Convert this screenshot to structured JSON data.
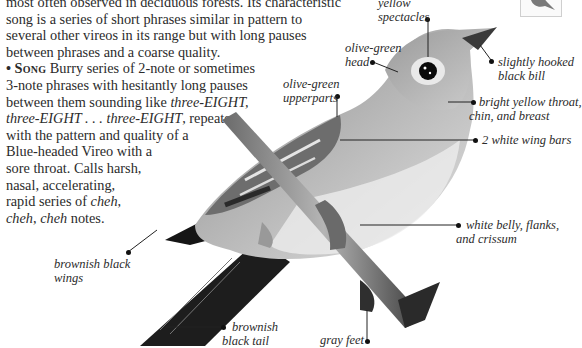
{
  "description": {
    "lines": [
      "most often observed in deciduous forests. Its characteristic",
      "song is a series of short phrases similar in pattern to",
      "several other vireos in its range but with long pauses",
      "between phrases and a coarse quality."
    ],
    "song": {
      "bullet": "•",
      "heading": "Song",
      "lines": [
        {
          "pre": " Burry series of 2-note or sometimes"
        },
        {
          "pre": "3-note phrases with hesitantly long pauses"
        },
        {
          "pre": "between them sounding like ",
          "em": "three-EIGHT,"
        },
        {
          "em": "three-EIGHT . . . three-EIGHT",
          "post": ", repeated"
        },
        {
          "pre": "with the pattern and quality of a"
        },
        {
          "pre": "Blue-headed Vireo with a"
        },
        {
          "pre": "sore throat. Calls harsh,"
        },
        {
          "pre": "nasal, accelerating,"
        },
        {
          "pre": "rapid series of ",
          "em": "cheh",
          "post": ","
        },
        {
          "em": "cheh",
          "mid": ", ",
          "em2": "cheh",
          "post": " notes."
        }
      ]
    }
  },
  "labels": {
    "yellow_spectacles": [
      "yellow",
      "spectacles"
    ],
    "olive_green_head": [
      "olive-green",
      "head"
    ],
    "slightly_hooked_bill": [
      "slightly hooked",
      "black bill"
    ],
    "olive_green_upperparts": [
      "olive-green",
      "upperparts"
    ],
    "bright_yellow_throat": [
      "bright yellow throat,",
      "chin, and breast"
    ],
    "white_wing_bars": [
      "2 white wing bars"
    ],
    "white_belly": [
      "white belly, flanks,",
      "and crissum"
    ],
    "brownish_black_wings": [
      "brownish black",
      "wings"
    ],
    "brownish_black_tail": [
      "brownish",
      "black tail"
    ],
    "gray_feet": [
      "gray feet"
    ]
  },
  "thumbnail": {
    "icon": "bird-silhouette-icon"
  }
}
